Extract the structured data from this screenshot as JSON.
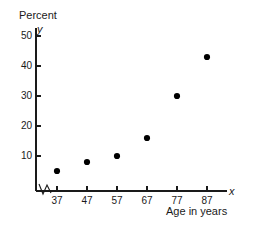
{
  "chart_data": {
    "type": "scatter",
    "title": "",
    "xlabel": "Age in years",
    "ylabel": "Percent",
    "x_axis_symbol": "x",
    "y_axis_symbol": "y",
    "x": [
      37,
      47,
      57,
      67,
      77,
      87
    ],
    "values": [
      5,
      8,
      10,
      16,
      30,
      43
    ],
    "series": [
      {
        "name": "Percent",
        "points": [
          {
            "x": 37,
            "y": 5
          },
          {
            "x": 47,
            "y": 8
          },
          {
            "x": 57,
            "y": 10
          },
          {
            "x": 67,
            "y": 16
          },
          {
            "x": 77,
            "y": 30
          },
          {
            "x": 87,
            "y": 43
          }
        ]
      }
    ],
    "xticks": [
      37,
      47,
      57,
      67,
      77,
      87
    ],
    "xtick_labels": [
      "37",
      "47",
      "57",
      "67",
      "77",
      "87"
    ],
    "yticks": [
      10,
      20,
      30,
      40,
      50
    ],
    "ytick_labels": [
      "10",
      "20",
      "30",
      "40",
      "50"
    ],
    "xlim": [
      32,
      92
    ],
    "ylim": [
      0,
      52
    ],
    "grid": false,
    "legend": false,
    "axis_break_x": true,
    "axis_break_y": true,
    "marker": "filled-circle",
    "marker_color": "#000000",
    "axis_color": "#1a1a1a",
    "background_color": "#ffffff"
  }
}
